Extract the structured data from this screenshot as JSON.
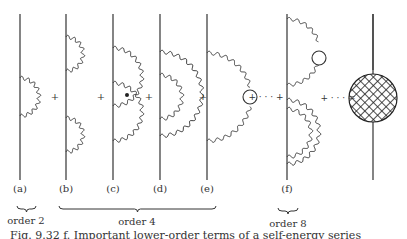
{
  "figure": {
    "diagrams": [
      {
        "id": "a",
        "label": "(a)"
      },
      {
        "id": "b",
        "label": "(b)"
      },
      {
        "id": "c",
        "label": "(c)"
      },
      {
        "id": "d",
        "label": "(d)"
      },
      {
        "id": "e",
        "label": "(e)"
      },
      {
        "id": "f",
        "label": "(f)"
      }
    ],
    "operators": {
      "plus": "+",
      "ellipsis": "+ · · · +",
      "equals": "+ · · · ="
    },
    "groups": [
      {
        "label": "order 2"
      },
      {
        "label": "order 4"
      },
      {
        "label": "order 8"
      }
    ],
    "caption": "Fig. 9.32  f. Important lower-order terms of a self-energy series"
  }
}
